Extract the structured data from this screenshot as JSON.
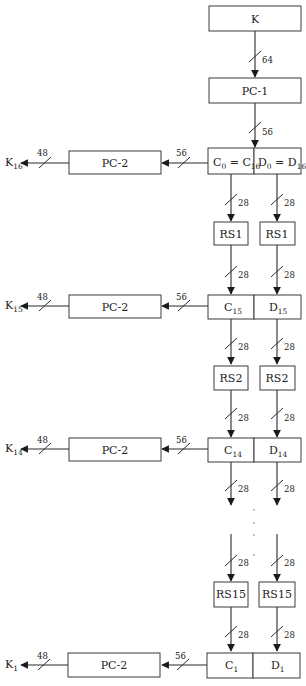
{
  "diagram": {
    "accent_color": "#2a2a2a",
    "top": {
      "key_box": "K",
      "key_width": "64",
      "pc1_box": "PC-1",
      "pc1_width": "56"
    },
    "rows": [
      {
        "c_main": "C",
        "c_sub": "0",
        "c_eq": " = C",
        "c_sub2": "16",
        "d_main": "D",
        "d_sub": "0",
        "d_eq": " = D",
        "d_sub2": "16",
        "pc2": "PC-2",
        "w56": "56",
        "w48": "48",
        "k_main": "K",
        "k_sub": "16"
      },
      {
        "c_main": "C",
        "c_sub": "15",
        "d_main": "D",
        "d_sub": "15",
        "pc2": "PC-2",
        "w56": "56",
        "w48": "48",
        "k_main": "K",
        "k_sub": "15"
      },
      {
        "c_main": "C",
        "c_sub": "14",
        "d_main": "D",
        "d_sub": "14",
        "pc2": "PC-2",
        "w56": "56",
        "w48": "48",
        "k_main": "K",
        "k_sub": "14"
      },
      {
        "c_main": "C",
        "c_sub": "1",
        "d_main": "D",
        "d_sub": "1",
        "pc2": "PC-2",
        "w56": "56",
        "w48": "48",
        "k_main": "K",
        "k_sub": "1"
      }
    ],
    "shift_stages": [
      {
        "label_c": "RS1",
        "label_d": "RS1",
        "in_width": "28",
        "out_width": "28"
      },
      {
        "label_c": "RS2",
        "label_d": "RS2",
        "in_width": "28",
        "out_width": "28"
      },
      {
        "label_c": "RS15",
        "label_d": "RS15",
        "in_width": "28",
        "out_width": "28"
      }
    ],
    "gap_width": "28",
    "ellipsis": "⋮"
  }
}
